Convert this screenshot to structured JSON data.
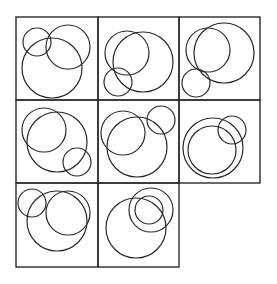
{
  "colors": {
    "stroke": "#2a2a2a",
    "background": "#ffffff"
  },
  "grid": {
    "origin": [
      16,
      17
    ],
    "col_edges": [
      16,
      98,
      179,
      260
    ],
    "row_edges": [
      17,
      100,
      183,
      267
    ],
    "rows": 3,
    "cols": 3,
    "missing_cell": [
      2,
      2
    ]
  },
  "cells": [
    {
      "row": 0,
      "col": 0,
      "circles": [
        {
          "cx": 37,
          "cy": 42,
          "r": 14
        },
        {
          "cx": 68,
          "cy": 47,
          "r": 22
        },
        {
          "cx": 52,
          "cy": 68,
          "r": 30
        }
      ]
    },
    {
      "row": 0,
      "col": 1,
      "circles": [
        {
          "cx": 127,
          "cy": 53,
          "r": 22
        },
        {
          "cx": 143,
          "cy": 62,
          "r": 30
        },
        {
          "cx": 118,
          "cy": 82,
          "r": 14
        }
      ]
    },
    {
      "row": 0,
      "col": 2,
      "circles": [
        {
          "cx": 208,
          "cy": 50,
          "r": 22
        },
        {
          "cx": 224,
          "cy": 53,
          "r": 30
        },
        {
          "cx": 196,
          "cy": 83,
          "r": 14
        }
      ]
    },
    {
      "row": 1,
      "col": 0,
      "circles": [
        {
          "cx": 44,
          "cy": 130,
          "r": 22
        },
        {
          "cx": 57,
          "cy": 142,
          "r": 30
        },
        {
          "cx": 77,
          "cy": 162,
          "r": 14
        }
      ]
    },
    {
      "row": 1,
      "col": 1,
      "circles": [
        {
          "cx": 123,
          "cy": 133,
          "r": 22
        },
        {
          "cx": 137,
          "cy": 147,
          "r": 30
        },
        {
          "cx": 161,
          "cy": 120,
          "r": 14
        }
      ]
    },
    {
      "row": 1,
      "col": 2,
      "circles": [
        {
          "cx": 213,
          "cy": 148,
          "r": 30
        },
        {
          "cx": 212,
          "cy": 150,
          "r": 24
        },
        {
          "cx": 232,
          "cy": 130,
          "r": 14
        }
      ]
    },
    {
      "row": 2,
      "col": 0,
      "circles": [
        {
          "cx": 32,
          "cy": 203,
          "r": 14
        },
        {
          "cx": 57,
          "cy": 221,
          "r": 30
        },
        {
          "cx": 68,
          "cy": 213,
          "r": 22
        }
      ]
    },
    {
      "row": 2,
      "col": 1,
      "circles": [
        {
          "cx": 136,
          "cy": 228,
          "r": 30
        },
        {
          "cx": 151,
          "cy": 210,
          "r": 22
        },
        {
          "cx": 149,
          "cy": 210,
          "r": 14
        }
      ]
    }
  ]
}
